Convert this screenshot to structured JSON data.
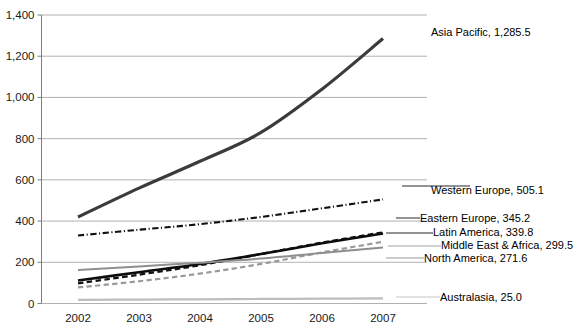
{
  "chart_data": {
    "type": "line",
    "title": "",
    "subtitle": "",
    "xlabel": "",
    "ylabel": "",
    "x": [
      "2002",
      "2003",
      "2004",
      "2005",
      "2006",
      "2007"
    ],
    "categories": [
      "2002",
      "2003",
      "2004",
      "2005",
      "2006",
      "2007"
    ],
    "xlim": [
      2002,
      2007
    ],
    "ylim": [
      0,
      1400
    ],
    "y_ticks": [
      "0",
      "200",
      "400",
      "600",
      "800",
      "1,000",
      "1,200",
      "1,400"
    ],
    "y_tick_values": [
      0,
      200,
      400,
      600,
      800,
      1000,
      1200,
      1400
    ],
    "grid": true,
    "legend_position": "inline-right-of-plot",
    "series": [
      {
        "name": "Asia Pacific",
        "end_value": "1,285.5",
        "label": "Asia Pacific, 1,285.5",
        "values": [
          420,
          560,
          690,
          830,
          1040,
          1285.5
        ],
        "style": "solid",
        "color": "#3b3b3b",
        "width": 3.2
      },
      {
        "name": "Western Europe",
        "end_value": "505.1",
        "label": "Western Europe, 505.1",
        "values": [
          330,
          358,
          385,
          420,
          462,
          505.1
        ],
        "style": "dashdot",
        "color": "#111111",
        "width": 2.1
      },
      {
        "name": "Eastern Europe",
        "end_value": "345.2",
        "label": "Eastern Europe, 345.2",
        "values": [
          98,
          140,
          186,
          240,
          295,
          345.2
        ],
        "style": "dashed",
        "color": "#111111",
        "width": 2.3
      },
      {
        "name": "Latin America",
        "end_value": "339.8",
        "label": "Latin America, 339.8",
        "values": [
          112,
          152,
          192,
          240,
          292,
          339.8
        ],
        "style": "solid",
        "color": "#0d0d0d",
        "width": 2.6
      },
      {
        "name": "Middle East & Africa",
        "end_value": "299.5",
        "label": "Middle East & Africa, 299.5",
        "values": [
          78,
          108,
          145,
          192,
          248,
          299.5
        ],
        "style": "dashed",
        "color": "#9a9a9a",
        "width": 2.2
      },
      {
        "name": "North America",
        "end_value": "271.6",
        "label": "North America, 271.6",
        "values": [
          162,
          180,
          198,
          218,
          245,
          271.6
        ],
        "style": "solid",
        "color": "#8e8e8e",
        "width": 2.0
      },
      {
        "name": "Australasia",
        "end_value": "25.0",
        "label": "Australasia, 25.0",
        "values": [
          18,
          19,
          20.5,
          22,
          23.5,
          25.0
        ],
        "style": "solid",
        "color": "#bdbdbd",
        "width": 2.2
      }
    ]
  },
  "axes": {
    "y_labels": [
      "1,400",
      "1,200",
      "1,000",
      "800",
      "600",
      "400",
      "200",
      "0"
    ],
    "x_labels": [
      "2002",
      "2003",
      "2004",
      "2005",
      "2006",
      "2007"
    ]
  },
  "labels": {
    "asia_pacific": "Asia Pacific, 1,285.5",
    "western_europe": "Western Europe, 505.1",
    "eastern_europe": "Eastern Europe, 345.2",
    "latin_america": "Latin America, 339.8",
    "middle_east_africa": "Middle East & Africa, 299.5",
    "north_america": "North America, 271.6",
    "australasia": "Australasia, 25.0"
  },
  "colors": {
    "asia_pacific": "#3b3b3b",
    "western_europe": "#111111",
    "eastern_europe": "#111111",
    "latin_america": "#0d0d0d",
    "middle_east_africa": "#9a9a9a",
    "north_america": "#8e8e8e",
    "australasia": "#bdbdbd",
    "gridline": "#a8a8a8",
    "axis": "#7d7d7d",
    "text": "#1a1a1a",
    "background": "#ffffff"
  }
}
